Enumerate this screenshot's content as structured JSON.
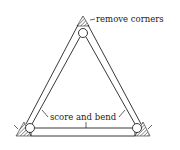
{
  "diagram": {
    "labels": {
      "top": "remove corners",
      "middle": "score and bend"
    },
    "colors": {
      "stroke": "#222222",
      "hatch": "#555555",
      "background": "#ffffff"
    }
  }
}
